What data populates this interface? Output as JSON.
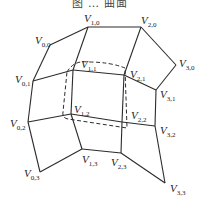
{
  "caption": "图 … 曲面",
  "vertices": [
    {
      "id": "V0,0",
      "main": "V",
      "sub": "0,0",
      "x": 50,
      "y": 45,
      "lx": 35,
      "ly": 44
    },
    {
      "id": "V1,0",
      "main": "V",
      "sub": "1,0",
      "x": 88,
      "y": 27,
      "lx": 84,
      "ly": 22
    },
    {
      "id": "V2,0",
      "main": "V",
      "sub": "2,0",
      "x": 141,
      "y": 27,
      "lx": 141,
      "ly": 24
    },
    {
      "id": "V3,0",
      "main": "V",
      "sub": "3,0",
      "x": 176,
      "y": 65,
      "lx": 179,
      "ly": 67
    },
    {
      "id": "V0,1",
      "main": "V",
      "sub": "0,1",
      "x": 33,
      "y": 81,
      "lx": 15,
      "ly": 83
    },
    {
      "id": "V1,1",
      "main": "V",
      "sub": "1,1",
      "x": 73,
      "y": 70,
      "lx": 81,
      "ly": 68
    },
    {
      "id": "V2,1",
      "main": "V",
      "sub": "2,1",
      "x": 124,
      "y": 75,
      "lx": 130,
      "ly": 78
    },
    {
      "id": "V3,1",
      "main": "V",
      "sub": "3,1",
      "x": 156,
      "y": 90,
      "lx": 160,
      "ly": 98
    },
    {
      "id": "V0,2",
      "main": "V",
      "sub": "0,2",
      "x": 28,
      "y": 122,
      "lx": 10,
      "ly": 127
    },
    {
      "id": "V1,2",
      "main": "V",
      "sub": "1,2",
      "x": 71,
      "y": 114,
      "lx": 74,
      "ly": 113
    },
    {
      "id": "V2,2",
      "main": "V",
      "sub": "2,2",
      "x": 122,
      "y": 122,
      "lx": 131,
      "ly": 119
    },
    {
      "id": "V3,2",
      "main": "V",
      "sub": "3,2",
      "x": 155,
      "y": 126,
      "lx": 160,
      "ly": 134
    },
    {
      "id": "V0,3",
      "main": "V",
      "sub": "0,3",
      "x": 40,
      "y": 172,
      "lx": 24,
      "ly": 177
    },
    {
      "id": "V1,3",
      "main": "V",
      "sub": "1,3",
      "x": 82,
      "y": 149,
      "lx": 82,
      "ly": 163
    },
    {
      "id": "V2,3",
      "main": "V",
      "sub": "2,3",
      "x": 121,
      "y": 153,
      "lx": 111,
      "ly": 166
    },
    {
      "id": "V3,3",
      "main": "V",
      "sub": "3,3",
      "x": 165,
      "y": 183,
      "lx": 170,
      "ly": 192
    }
  ],
  "dashed_patch": "M67,72 Q74,60 88,62 Q110,62 125,68 L127,128 L68,119 Q62,118 63,112 Z"
}
